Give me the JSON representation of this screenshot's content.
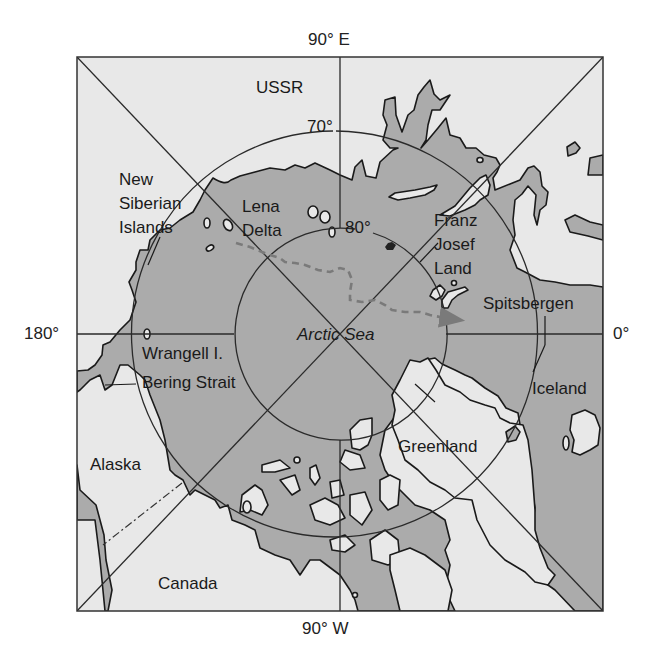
{
  "map": {
    "title": "Arctic region polar projection",
    "edge_labels": {
      "top": "90° E",
      "bottom": "90° W",
      "left": "180°",
      "right": "0°"
    },
    "latitude_labels": {
      "outer": "70°",
      "inner": "80°"
    },
    "places": {
      "ussr": "USSR",
      "new_siberian_1": "New",
      "new_siberian_2": "Siberian",
      "new_siberian_3": "Islands",
      "lena_1": "Lena",
      "lena_2": "Delta",
      "franz_1": "Franz",
      "franz_2": "Josef",
      "franz_3": "Land",
      "spitsbergen": "Spitsbergen",
      "arctic_sea": "Arctic Sea",
      "wrangell": "Wrangell I.",
      "bering": "Bering Strait",
      "iceland": "Iceland",
      "greenland": "Greenland",
      "alaska": "Alaska",
      "canada": "Canada"
    },
    "colors": {
      "sea": "#ababab",
      "land": "#e8e8e8",
      "lines": "#1a1a1a",
      "route": "#7a7a7a"
    }
  }
}
